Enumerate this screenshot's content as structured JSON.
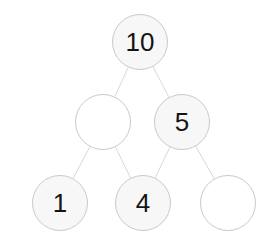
{
  "diagram": {
    "type": "binary-tree",
    "background_color": "#ffffff",
    "node_fill_color": "#f7f7f7",
    "node_empty_fill_color": "#ffffff",
    "node_border_color": "#c9c9c9",
    "node_text_color": "#141414",
    "edge_color": "#d8d8d8",
    "nodes": [
      {
        "id": "root",
        "label": "10",
        "empty": false,
        "cx": 140,
        "cy": 42,
        "r": 28,
        "row": 0
      },
      {
        "id": "mid-left",
        "label": "",
        "empty": true,
        "cx": 103,
        "cy": 122,
        "r": 28,
        "row": 1
      },
      {
        "id": "mid-right",
        "label": "5",
        "empty": false,
        "cx": 182,
        "cy": 122,
        "r": 28,
        "row": 1
      },
      {
        "id": "leaf-one",
        "label": "1",
        "empty": false,
        "cx": 60,
        "cy": 203,
        "r": 28,
        "row": 2
      },
      {
        "id": "leaf-four",
        "label": "4",
        "empty": false,
        "cx": 143,
        "cy": 203,
        "r": 28,
        "row": 2
      },
      {
        "id": "leaf-empty",
        "label": "",
        "empty": true,
        "cx": 228,
        "cy": 203,
        "r": 28,
        "row": 2
      }
    ],
    "edges": [
      {
        "id": "edge-root-midleft",
        "from": "root",
        "to": "mid-left"
      },
      {
        "id": "edge-root-midright",
        "from": "root",
        "to": "mid-right"
      },
      {
        "id": "edge-midleft-leafone",
        "from": "mid-left",
        "to": "leaf-one"
      },
      {
        "id": "edge-midleft-leaffour",
        "from": "mid-left",
        "to": "leaf-four"
      },
      {
        "id": "edge-midright-leaffour",
        "from": "mid-right",
        "to": "leaf-four"
      },
      {
        "id": "edge-midright-leafempty",
        "from": "mid-right",
        "to": "leaf-empty"
      }
    ]
  }
}
